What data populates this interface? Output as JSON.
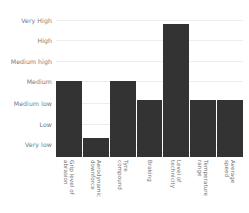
{
  "chart_data": {
    "type": "bar",
    "title": "",
    "xlabel": "",
    "ylabel": "",
    "grid": true,
    "legend": false,
    "orientation": "vertical",
    "bar_color": "#333333",
    "grid_color": "#ededed",
    "text_color": "#7a7a7a",
    "background": "#ffffff",
    "y_scale": "ordinal",
    "y_categories": [
      "Very low",
      "Low",
      "Medium low",
      "Medium",
      "Medium high",
      "High",
      "Very High"
    ],
    "y_tick_labels_top_to_bottom": [
      "Very High",
      "High",
      "Medium high",
      "Medium",
      "Medium low",
      "Low",
      "Very low"
    ],
    "categories": [
      "Grip level of abrasion",
      "Aerodynamic downforce",
      "Tyre compound",
      "Braking",
      "Level of technicity",
      "Temperature range",
      "Average speed"
    ],
    "category_lines": [
      [
        "Grip level of",
        "abrasion"
      ],
      [
        "Aerodynamic",
        "downforce"
      ],
      [
        "Tyre",
        "compound"
      ],
      [
        "Braking",
        ""
      ],
      [
        "Level of",
        "technicity"
      ],
      [
        "Temperature",
        "range"
      ],
      [
        "Average",
        "speed"
      ]
    ],
    "values": [
      "Medium",
      "Very low",
      "Medium",
      "Medium low",
      "Very High",
      "Medium low",
      "Medium low"
    ],
    "values_numeric": [
      4,
      1,
      4,
      3,
      7,
      3,
      3
    ],
    "ylim": [
      0,
      7.5
    ]
  }
}
